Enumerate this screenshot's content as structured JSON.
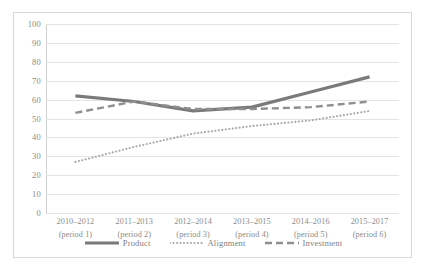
{
  "chart_data": {
    "type": "line",
    "title": "",
    "xlabel": "",
    "ylabel": "",
    "ylim": [
      0,
      100
    ],
    "yticks": [
      100,
      90,
      80,
      70,
      60,
      50,
      40,
      30,
      20,
      10,
      0
    ],
    "grid": true,
    "legend_position": "bottom",
    "categories": [
      "2010–2012 (period 1)",
      "2011–2013 (period 2)",
      "2012–2014 (period 3)",
      "2013–2015 (period 4)",
      "2014–2016 (period 5)",
      "2015–2017 (period 6)"
    ],
    "category_lines": [
      {
        "top": "2010–2012",
        "bottom": "(period 1)"
      },
      {
        "top": "2011–2013",
        "bottom": "(period 2)"
      },
      {
        "top": "2012–2014",
        "bottom": "(period 3)"
      },
      {
        "top": "2013–2015",
        "bottom": "(period 4)"
      },
      {
        "top": "2014–2016",
        "bottom": "(period 5)"
      },
      {
        "top": "2015–2017",
        "bottom": "(period 6)"
      }
    ],
    "series": [
      {
        "name": "Product",
        "values": [
          62,
          59,
          54,
          56,
          64,
          72
        ],
        "style": "solid",
        "color": "#7a7a7a",
        "width": 3.2
      },
      {
        "name": "Alignment",
        "values": [
          27,
          35,
          42,
          46,
          49,
          54
        ],
        "style": "dotted",
        "color": "#a8a8a8",
        "width": 2.1
      },
      {
        "name": "Investment",
        "values": [
          53,
          59,
          55,
          55,
          56,
          59
        ],
        "style": "dashed",
        "color": "#8f8f8f",
        "width": 2.4
      }
    ]
  },
  "legend": {
    "items": [
      {
        "label": "Product"
      },
      {
        "label": "Alignment"
      },
      {
        "label": "Investment"
      }
    ]
  },
  "axis": {
    "y_tick_labels": [
      "100",
      "90",
      "80",
      "70",
      "60",
      "50",
      "40",
      "30",
      "20",
      "10",
      "0"
    ]
  },
  "colors": {
    "frame": "#d8d8d8",
    "gridline": "#e4e4e4",
    "tick_text": "#8b8b8b",
    "legend_text": "#7f7f7f",
    "background": "#ffffff"
  }
}
